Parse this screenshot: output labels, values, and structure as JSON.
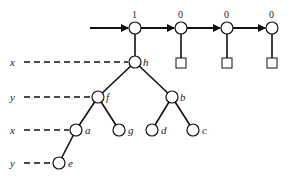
{
  "diagram": {
    "header_nodes": [
      {
        "value": "1",
        "x": 135,
        "y": 28
      },
      {
        "value": "0",
        "x": 181,
        "y": 28
      },
      {
        "value": "0",
        "x": 227,
        "y": 28
      },
      {
        "value": "0",
        "x": 272,
        "y": 28
      }
    ],
    "tree_nodes": [
      {
        "id": "h",
        "label": "h",
        "x": 135,
        "y": 62
      },
      {
        "id": "f",
        "label": "f",
        "x": 98,
        "y": 97
      },
      {
        "id": "b",
        "label": "b",
        "x": 172,
        "y": 97
      },
      {
        "id": "a",
        "label": "a",
        "x": 76,
        "y": 130
      },
      {
        "id": "g",
        "label": "g",
        "x": 119,
        "y": 130
      },
      {
        "id": "d",
        "label": "d",
        "x": 152,
        "y": 130
      },
      {
        "id": "c",
        "label": "c",
        "x": 193,
        "y": 130
      },
      {
        "id": "e",
        "label": "e",
        "x": 59,
        "y": 163
      }
    ],
    "pointers": [
      {
        "label": "x",
        "target": "h"
      },
      {
        "label": "y",
        "target": "f"
      },
      {
        "label": "x",
        "target": "a"
      },
      {
        "label": "y",
        "target": "e"
      }
    ]
  }
}
